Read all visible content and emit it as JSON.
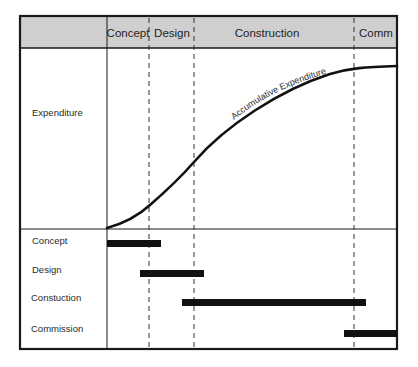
{
  "diagram": {
    "header": {
      "phases": [
        {
          "label": "Concept",
          "x_start": 107,
          "x_end": 149
        },
        {
          "label": "Design",
          "x_start": 149,
          "x_end": 194
        },
        {
          "label": "Construction",
          "x_start": 194,
          "x_end": 354
        },
        {
          "label": "Comm",
          "x_start": 354,
          "x_end": 397
        }
      ]
    },
    "upper_panel": {
      "row_label": "Expenditure",
      "curve_label": "Accumulative Expenditure"
    },
    "gantt": {
      "rows": [
        {
          "label": "Concept",
          "bar_start": 107,
          "bar_end": 161
        },
        {
          "label": "Design",
          "bar_start": 140,
          "bar_end": 204
        },
        {
          "label": "Constuction",
          "bar_start": 182,
          "bar_end": 366
        },
        {
          "label": "Commission",
          "bar_start": 344,
          "bar_end": 397
        }
      ]
    },
    "colors": {
      "header_fill": "#cfcfcf",
      "frame": "#1a1a1a",
      "bar": "#111111",
      "dashed": "#333333"
    }
  }
}
